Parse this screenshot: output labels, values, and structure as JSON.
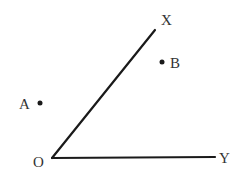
{
  "diagram": {
    "type": "angle",
    "vertex": {
      "label": "O",
      "x": 52,
      "y": 158
    },
    "rays": [
      {
        "name": "OX",
        "end_label": "X",
        "x2": 155,
        "y2": 30
      },
      {
        "name": "OY",
        "end_label": "Y",
        "x2": 215,
        "y2": 157
      }
    ],
    "points": [
      {
        "label": "A",
        "x": 40,
        "y": 103
      },
      {
        "label": "B",
        "x": 162,
        "y": 62
      }
    ],
    "colors": {
      "stroke": "#1a1a1a",
      "text": "#333333"
    }
  },
  "labels": {
    "X": "X",
    "Y": "Y",
    "O": "O",
    "A": "A",
    "B": "B"
  }
}
